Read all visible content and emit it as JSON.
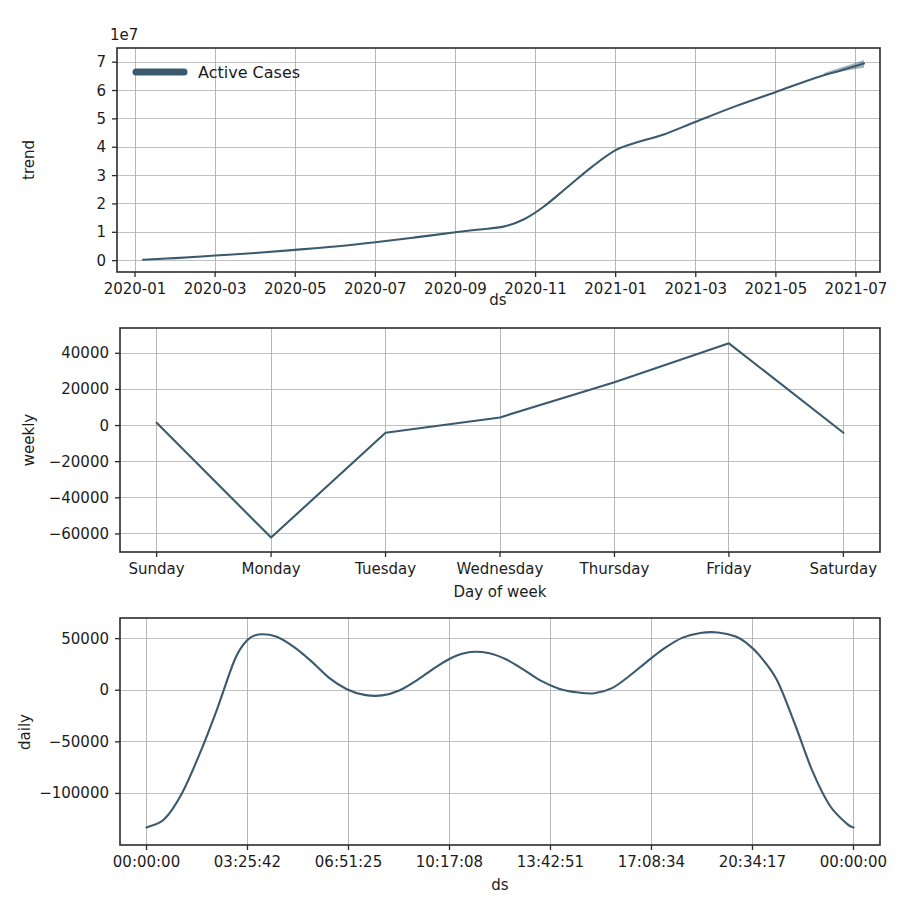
{
  "figure": {
    "kind": "prophet-components",
    "background": "#ffffff",
    "line_color": "#3b5a6e",
    "grid_color": "#b9b9b9",
    "axis_color": "#2b2b2b"
  },
  "legend": {
    "label": "Active Cases",
    "marker": "line-swatch"
  },
  "chart_data": [
    {
      "type": "line",
      "name": "trend",
      "title": "",
      "xlabel": "ds",
      "ylabel": "trend",
      "y_offset_text": "1e7",
      "y_offset_value": 10000000,
      "grid": true,
      "legend": [
        "Active Cases"
      ],
      "legend_position": "upper left",
      "xtick_labels": [
        "2020-01",
        "2020-03",
        "2020-05",
        "2020-07",
        "2020-09",
        "2020-11",
        "2021-01",
        "2021-03",
        "2021-05",
        "2021-07"
      ],
      "xtick_positions": [
        0,
        2,
        4,
        6,
        8,
        10,
        12,
        14,
        16,
        18
      ],
      "xlim": [
        -0.45,
        18.6
      ],
      "ytick_labels": [
        "0",
        "1",
        "2",
        "3",
        "4",
        "5",
        "6",
        "7"
      ],
      "ytick_values": [
        0,
        10000000,
        20000000,
        30000000,
        40000000,
        50000000,
        60000000,
        70000000
      ],
      "ylim": [
        -4000000,
        75000000
      ],
      "x": [
        0.2,
        1,
        2,
        3,
        4,
        5,
        6,
        7,
        8,
        8.6,
        9.2,
        9.7,
        10.2,
        10.8,
        11.4,
        12.0,
        12.6,
        13.2,
        14.0,
        15.0,
        16.0,
        17.0,
        17.6,
        18.2
      ],
      "y": [
        300000,
        900000,
        1800000,
        2700000,
        3800000,
        5000000,
        6500000,
        8200000,
        10000000,
        11000000,
        12000000,
        14500000,
        19000000,
        26000000,
        33000000,
        39000000,
        42000000,
        44500000,
        49000000,
        54500000,
        59500000,
        64500000,
        67000000,
        69500000
      ],
      "uncertainty": {
        "x": [
          17.2,
          17.6,
          18.0,
          18.2
        ],
        "lower": [
          65500000,
          66600000,
          67600000,
          68000000
        ],
        "upper": [
          66200000,
          68000000,
          69800000,
          70800000
        ]
      }
    },
    {
      "type": "line",
      "name": "weekly",
      "title": "",
      "xlabel": "Day of week",
      "ylabel": "weekly",
      "grid": true,
      "xtick_labels": [
        "Sunday",
        "Monday",
        "Tuesday",
        "Wednesday",
        "Thursday",
        "Friday",
        "Saturday"
      ],
      "xtick_positions": [
        0,
        1,
        2,
        3,
        4,
        5,
        6
      ],
      "xlim": [
        -0.32,
        6.32
      ],
      "ytick_labels": [
        "40000",
        "20000",
        "0",
        "-20000",
        "-40000",
        "-60000"
      ],
      "ytick_values": [
        40000,
        20000,
        0,
        -20000,
        -40000,
        -60000
      ],
      "ylim": [
        -70000,
        54000
      ],
      "categories": [
        "Sunday",
        "Monday",
        "Tuesday",
        "Wednesday",
        "Thursday",
        "Friday",
        "Saturday"
      ],
      "values": [
        1500,
        -62000,
        -4000,
        4500,
        24000,
        45500,
        -4000
      ]
    },
    {
      "type": "line",
      "name": "daily",
      "title": "",
      "xlabel": "ds",
      "ylabel": "daily",
      "grid": true,
      "xtick_labels": [
        "00:00:00",
        "03:25:42",
        "06:51:25",
        "10:17:08",
        "13:42:51",
        "17:08:34",
        "20:34:17",
        "00:00:00"
      ],
      "xtick_positions": [
        0,
        3.428,
        6.857,
        10.285,
        13.714,
        17.142,
        20.571,
        24
      ],
      "xlim": [
        -0.9,
        24.9
      ],
      "ytick_labels": [
        "50000",
        "0",
        "-50000",
        "-100000"
      ],
      "ytick_values": [
        50000,
        0,
        -50000,
        -100000
      ],
      "ylim": [
        -150000,
        70000
      ],
      "x": [
        0,
        0.6,
        1.2,
        1.8,
        2.4,
        3.0,
        3.4,
        3.8,
        4.4,
        5.0,
        5.6,
        6.2,
        6.8,
        7.4,
        8.0,
        8.6,
        9.2,
        9.8,
        10.4,
        11.0,
        11.6,
        12.2,
        12.8,
        13.4,
        14.0,
        14.6,
        15.2,
        15.8,
        16.4,
        17.0,
        17.6,
        18.2,
        18.8,
        19.4,
        20.0,
        20.4,
        20.8,
        21.4,
        22.0,
        22.6,
        23.2,
        23.8,
        24
      ],
      "y": [
        -133000,
        -125000,
        -100000,
        -62000,
        -18000,
        30000,
        48000,
        54000,
        52000,
        42000,
        28000,
        12000,
        1000,
        -4500,
        -5000,
        0,
        10000,
        22000,
        32000,
        37000,
        36000,
        30000,
        20000,
        9000,
        1500,
        -2000,
        -3000,
        2000,
        14000,
        28000,
        41000,
        51000,
        55500,
        56000,
        52000,
        45000,
        34000,
        10000,
        -32000,
        -78000,
        -112000,
        -130000,
        -133000
      ]
    }
  ]
}
